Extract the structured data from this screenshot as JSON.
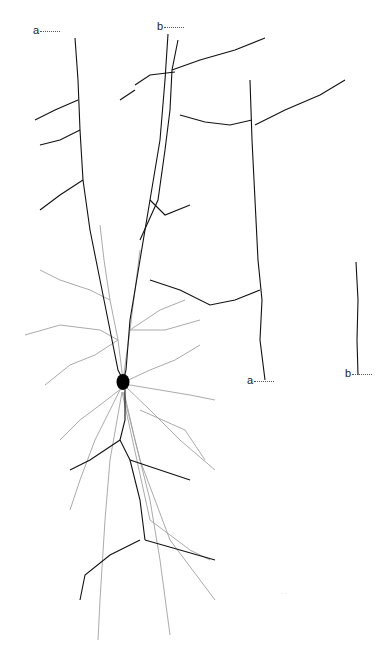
{
  "figure": {
    "labels": [
      {
        "id": "a_top",
        "text": "a",
        "x": 33,
        "y": 30
      },
      {
        "id": "b_top",
        "text": "b",
        "x": 157,
        "y": 24
      },
      {
        "id": "a_bottom",
        "text": "a",
        "x": 247,
        "y": 378
      },
      {
        "id": "b_bottom",
        "text": "b",
        "x": 345,
        "y": 371
      }
    ],
    "scale_bar": {
      "text": "· ·"
    },
    "colors": {
      "axon": "#111111",
      "dendrite": "#9a9a9a",
      "soma": "#000000",
      "background": "#ffffff"
    }
  }
}
